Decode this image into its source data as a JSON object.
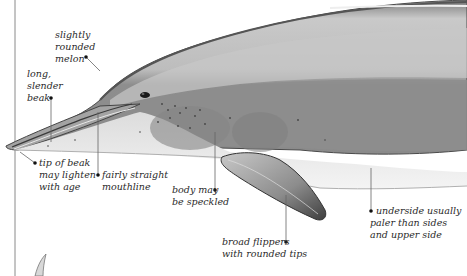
{
  "illustration": {
    "subject": "dolphin head and forebody, side view",
    "colors": {
      "background": "#ffffff",
      "upper_body": "#b8b8b8",
      "flank": "#8f8f8f",
      "underside": "#ececec",
      "outline": "#3a3a3a",
      "leader_line": "#555555"
    }
  },
  "annotations": [
    {
      "id": "melon",
      "lines": [
        "slightly",
        "rounded",
        "melon"
      ]
    },
    {
      "id": "beak",
      "lines": [
        "long,",
        "slender",
        "beak"
      ]
    },
    {
      "id": "beak-tip",
      "lines": [
        "tip of beak",
        "may lighten",
        "with age"
      ]
    },
    {
      "id": "mouthline",
      "lines": [
        "fairly straight",
        "mouthline"
      ]
    },
    {
      "id": "speckled",
      "lines": [
        "body may",
        "be speckled"
      ]
    },
    {
      "id": "flippers",
      "lines": [
        "broad flippers",
        "with rounded tips"
      ]
    },
    {
      "id": "underside",
      "lines": [
        "underside usually",
        "paler than sides",
        "and upper side"
      ]
    }
  ]
}
